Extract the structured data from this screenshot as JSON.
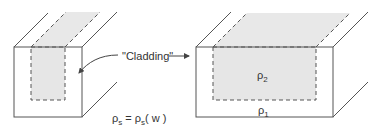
{
  "diagram": {
    "cladding_label": "\"Cladding\"",
    "rho2_label": "ρ",
    "rho2_sub": "2",
    "rho1_label": "ρ",
    "rho1_sub": "1",
    "equation": {
      "lhs": "ρ",
      "lhs_sub": "s",
      "eq": " = ",
      "rhs": "ρ",
      "rhs_sub": "s",
      "arg": "( w )"
    },
    "colors": {
      "line": "#555555",
      "fill_core": "#e6e6e6",
      "text": "#333333"
    }
  }
}
